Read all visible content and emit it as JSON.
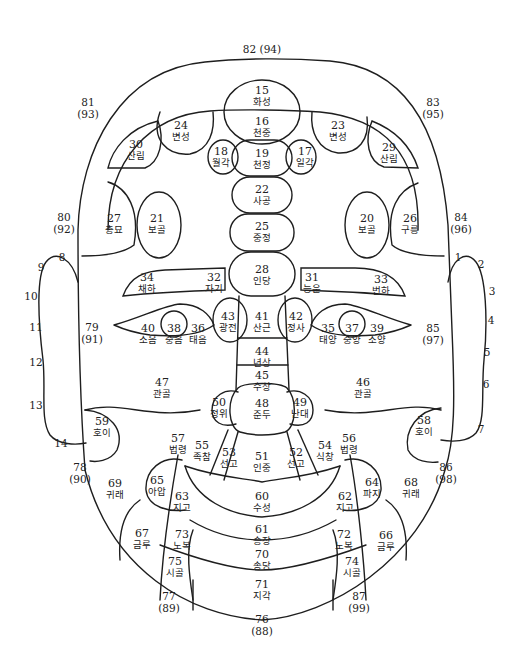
{
  "diagram": {
    "regions": [
      {
        "num": "15",
        "name": "화성",
        "x": 262,
        "y": 96
      },
      {
        "num": "16",
        "name": "천중",
        "x": 262,
        "y": 127
      },
      {
        "num": "19",
        "name": "천정",
        "x": 262,
        "y": 159
      },
      {
        "num": "18",
        "name": "월각",
        "x": 221,
        "y": 157
      },
      {
        "num": "17",
        "name": "일각",
        "x": 305,
        "y": 157
      },
      {
        "num": "22",
        "name": "사공",
        "x": 262,
        "y": 195
      },
      {
        "num": "25",
        "name": "중정",
        "x": 262,
        "y": 232
      },
      {
        "num": "28",
        "name": "인당",
        "x": 262,
        "y": 275
      },
      {
        "num": "24",
        "name": "변성",
        "x": 181,
        "y": 131
      },
      {
        "num": "23",
        "name": "변성",
        "x": 338,
        "y": 131
      },
      {
        "num": "30",
        "name": "산림",
        "x": 136,
        "y": 150
      },
      {
        "num": "29",
        "name": "산림",
        "x": 389,
        "y": 153
      },
      {
        "num": "27",
        "name": "총묘",
        "x": 114,
        "y": 224
      },
      {
        "num": "21",
        "name": "보골",
        "x": 157,
        "y": 224
      },
      {
        "num": "20",
        "name": "보골",
        "x": 367,
        "y": 224
      },
      {
        "num": "26",
        "name": "구릉",
        "x": 410,
        "y": 224
      },
      {
        "num": "34",
        "name": "채하",
        "x": 147,
        "y": 283
      },
      {
        "num": "32",
        "name": "자기",
        "x": 214,
        "y": 283
      },
      {
        "num": "31",
        "name": "능운",
        "x": 312,
        "y": 283
      },
      {
        "num": "33",
        "name": "번하",
        "x": 381,
        "y": 285
      },
      {
        "num": "43",
        "name": "광전",
        "x": 228,
        "y": 322
      },
      {
        "num": "41",
        "name": "산근",
        "x": 262,
        "y": 322
      },
      {
        "num": "42",
        "name": "정사",
        "x": 296,
        "y": 322
      },
      {
        "num": "40",
        "name": "소음",
        "x": 148,
        "y": 334
      },
      {
        "num": "38",
        "name": "중음",
        "x": 174,
        "y": 334
      },
      {
        "num": "36",
        "name": "태음",
        "x": 198,
        "y": 334
      },
      {
        "num": "35",
        "name": "태양",
        "x": 328,
        "y": 334
      },
      {
        "num": "37",
        "name": "중양",
        "x": 352,
        "y": 334
      },
      {
        "num": "39",
        "name": "소양",
        "x": 377,
        "y": 334
      },
      {
        "num": "44",
        "name": "년상",
        "x": 262,
        "y": 357
      },
      {
        "num": "45",
        "name": "수상",
        "x": 262,
        "y": 381
      },
      {
        "num": "47",
        "name": "관골",
        "x": 162,
        "y": 388
      },
      {
        "num": "46",
        "name": "관골",
        "x": 363,
        "y": 388
      },
      {
        "num": "48",
        "name": "준두",
        "x": 262,
        "y": 409
      },
      {
        "num": "50",
        "name": "정위",
        "x": 219,
        "y": 408
      },
      {
        "num": "49",
        "name": "난대",
        "x": 300,
        "y": 408
      },
      {
        "num": "59",
        "name": "호이",
        "x": 102,
        "y": 427
      },
      {
        "num": "58",
        "name": "호이",
        "x": 424,
        "y": 426
      },
      {
        "num": "57",
        "name": "법령",
        "x": 178,
        "y": 444
      },
      {
        "num": "55",
        "name": "족참",
        "x": 202,
        "y": 451
      },
      {
        "num": "53",
        "name": "선고",
        "x": 229,
        "y": 458
      },
      {
        "num": "51",
        "name": "인중",
        "x": 262,
        "y": 462
      },
      {
        "num": "52",
        "name": "선고",
        "x": 296,
        "y": 458
      },
      {
        "num": "54",
        "name": "식창",
        "x": 325,
        "y": 451
      },
      {
        "num": "56",
        "name": "법령",
        "x": 349,
        "y": 444
      },
      {
        "num": "69",
        "name": "귀래",
        "x": 115,
        "y": 489
      },
      {
        "num": "65",
        "name": "아압",
        "x": 157,
        "y": 486
      },
      {
        "num": "63",
        "name": "지고",
        "x": 182,
        "y": 502
      },
      {
        "num": "60",
        "name": "수성",
        "x": 262,
        "y": 502
      },
      {
        "num": "62",
        "name": "지고",
        "x": 345,
        "y": 502
      },
      {
        "num": "64",
        "name": "파지",
        "x": 372,
        "y": 488
      },
      {
        "num": "68",
        "name": "귀래",
        "x": 411,
        "y": 488
      },
      {
        "num": "67",
        "name": "금루",
        "x": 142,
        "y": 539
      },
      {
        "num": "73",
        "name": "노복",
        "x": 182,
        "y": 540
      },
      {
        "num": "61",
        "name": "승장",
        "x": 262,
        "y": 535
      },
      {
        "num": "72",
        "name": "노복",
        "x": 344,
        "y": 540
      },
      {
        "num": "66",
        "name": "금루",
        "x": 386,
        "y": 541
      },
      {
        "num": "70",
        "name": "송당",
        "x": 262,
        "y": 560
      },
      {
        "num": "75",
        "name": "시골",
        "x": 175,
        "y": 567
      },
      {
        "num": "74",
        "name": "시골",
        "x": 352,
        "y": 567
      },
      {
        "num": "71",
        "name": "지각",
        "x": 262,
        "y": 590
      }
    ],
    "edge_labels": [
      {
        "num": "82",
        "alt": "(94)",
        "x": 262,
        "y": 50,
        "inline": true
      },
      {
        "num": "81",
        "alt": "(93)",
        "x": 88,
        "y": 109
      },
      {
        "num": "83",
        "alt": "(95)",
        "x": 433,
        "y": 109
      },
      {
        "num": "80",
        "alt": "(92)",
        "x": 64,
        "y": 224
      },
      {
        "num": "84",
        "alt": "(96)",
        "x": 461,
        "y": 224
      },
      {
        "num": "79",
        "alt": "(91)",
        "x": 92,
        "y": 334
      },
      {
        "num": "85",
        "alt": "(97)",
        "x": 433,
        "y": 335
      },
      {
        "num": "78",
        "alt": "(90)",
        "x": 80,
        "y": 474
      },
      {
        "num": "86",
        "alt": "(98)",
        "x": 446,
        "y": 474
      },
      {
        "num": "77",
        "alt": "(89)",
        "x": 169,
        "y": 603
      },
      {
        "num": "87",
        "alt": "(99)",
        "x": 359,
        "y": 603
      },
      {
        "num": "76",
        "alt": "(88)",
        "x": 262,
        "y": 626
      }
    ],
    "ear_points_left": [
      {
        "num": "8",
        "x": 62,
        "y": 258
      },
      {
        "num": "9",
        "x": 41,
        "y": 268
      },
      {
        "num": "10",
        "x": 31,
        "y": 297
      },
      {
        "num": "11",
        "x": 36,
        "y": 328
      },
      {
        "num": "12",
        "x": 36,
        "y": 363
      },
      {
        "num": "13",
        "x": 36,
        "y": 406
      },
      {
        "num": "14",
        "x": 61,
        "y": 444
      }
    ],
    "ear_points_right": [
      {
        "num": "1",
        "x": 458,
        "y": 258
      },
      {
        "num": "2",
        "x": 481,
        "y": 265
      },
      {
        "num": "3",
        "x": 492,
        "y": 292
      },
      {
        "num": "4",
        "x": 491,
        "y": 321
      },
      {
        "num": "5",
        "x": 487,
        "y": 353
      },
      {
        "num": "6",
        "x": 486,
        "y": 385
      },
      {
        "num": "7",
        "x": 481,
        "y": 430
      }
    ],
    "colors": {
      "line": "#1e1e1e",
      "text": "#222222",
      "background": "#ffffff"
    }
  }
}
